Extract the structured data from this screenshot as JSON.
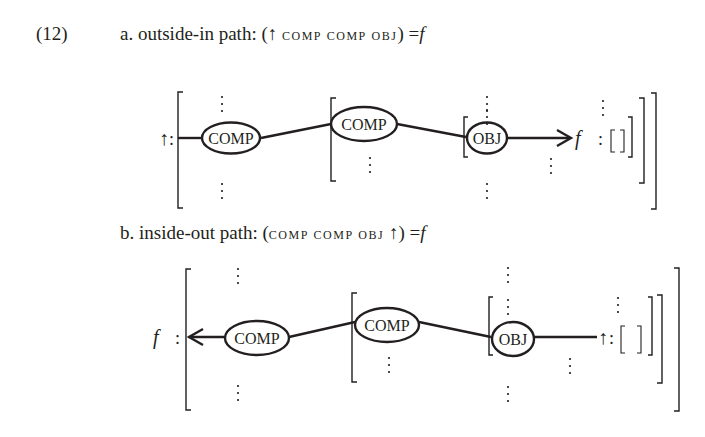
{
  "example": {
    "number": "(12)",
    "items": [
      {
        "label": "a.",
        "title": "outside-in path:",
        "open": "(",
        "expression_parts": [
          "↑",
          "comp",
          "comp",
          "obj"
        ],
        "close": ")",
        "equals": "=",
        "value": "f",
        "diagram": {
          "start_symbol": "↑",
          "end_symbol": "f",
          "nodes": [
            "COMP",
            "COMP",
            "OBJ"
          ],
          "empty_structure": "[ ]",
          "arrow_direction": "right"
        }
      },
      {
        "label": "b.",
        "title": "inside-out path:",
        "open": "(",
        "expression_parts": [
          "comp",
          "comp",
          "obj",
          "↑"
        ],
        "close": ")",
        "equals": "=",
        "value": "f",
        "diagram": {
          "start_symbol": "f",
          "end_symbol": "↑",
          "nodes": [
            "COMP",
            "COMP",
            "OBJ"
          ],
          "empty_structure": "[ ]",
          "arrow_direction": "left"
        }
      }
    ]
  },
  "colors": {
    "ink": "#231f20",
    "background": "#ffffff"
  }
}
